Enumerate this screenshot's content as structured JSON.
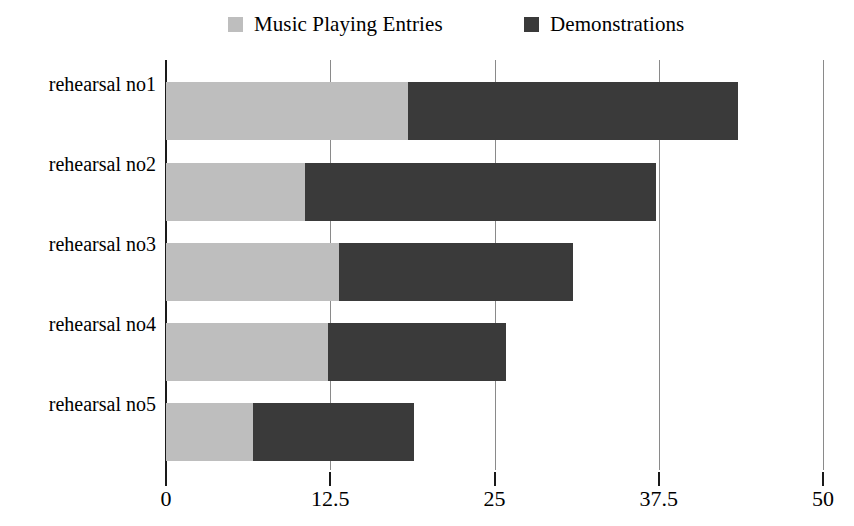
{
  "chart_data": {
    "type": "bar",
    "orientation": "horizontal",
    "stacked": true,
    "title": "",
    "subtitle": "",
    "xlabel": "",
    "ylabel": "",
    "xlim": [
      0,
      50
    ],
    "xticks": [
      "0",
      "12.5",
      "25",
      "37.5",
      "50"
    ],
    "xtick_values": [
      0,
      12.5,
      25,
      37.5,
      50
    ],
    "grid": true,
    "grid_axis": "x",
    "legend_position": "top",
    "categories": [
      "rehearsal no1",
      "rehearsal no2",
      "rehearsal no3",
      "rehearsal no4",
      "rehearsal no5"
    ],
    "series": [
      {
        "name": "Music Playing Entries",
        "color": "#bebebe",
        "values": [
          18.4,
          10.6,
          13.2,
          12.3,
          6.6
        ]
      },
      {
        "name": "Demonstrations",
        "color": "#3a3a3a",
        "values": [
          25.1,
          26.7,
          17.8,
          13.6,
          12.3
        ]
      }
    ],
    "totals": [
      43.5,
      37.3,
      31.0,
      25.9,
      18.9
    ]
  },
  "legend": {
    "entries": [
      {
        "label": "Music Playing Entries",
        "color": "#bebebe",
        "swatch": "square-swatch-light"
      },
      {
        "label": "Demonstrations",
        "color": "#3a3a3a",
        "swatch": "square-swatch-dark"
      }
    ]
  },
  "axis": {
    "gridline_color": "#8a8a8a",
    "axis_color": "#1a1a1a"
  }
}
